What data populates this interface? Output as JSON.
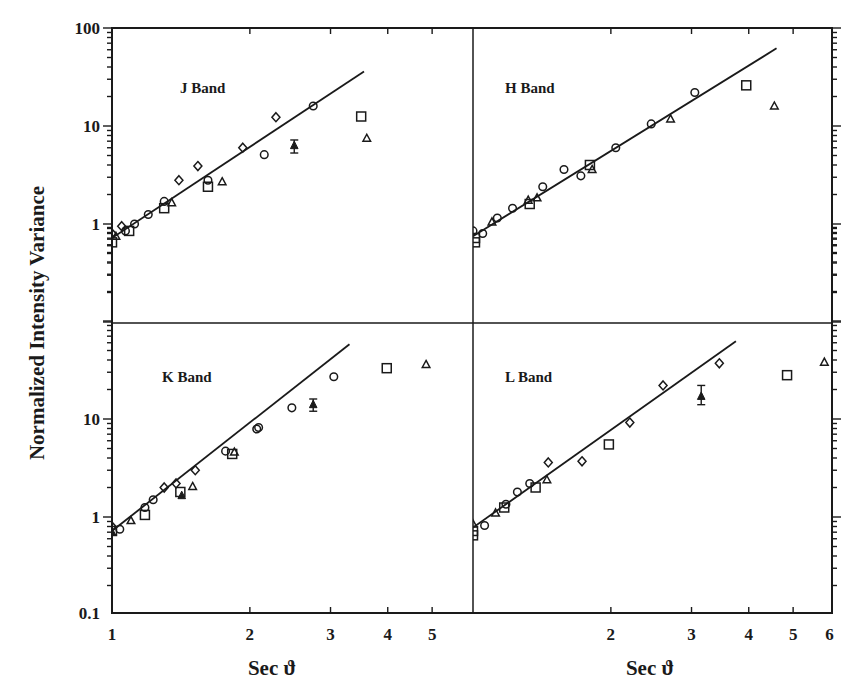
{
  "chart_data": {
    "type": "scatter",
    "title": "",
    "ylabel": "Normalized Intensity Variance",
    "xlabel": "Sec ϑ",
    "xscale": "log",
    "yscale": "log",
    "grid": false,
    "legend": "none",
    "layout": "2x2 panels sharing axes",
    "y_ticks_top": [
      "100",
      "10",
      "1"
    ],
    "y_ticks_bottom": [
      "10",
      "1",
      "0.1"
    ],
    "x_ticks_left": [
      "1",
      "2",
      "3",
      "4",
      "5"
    ],
    "x_ticks_right": [
      "2",
      "3",
      "4",
      "5",
      "6"
    ],
    "marker_types": [
      "diamond",
      "circle",
      "square",
      "triangle",
      "filled-triangle-with-errorbar"
    ],
    "panels": [
      {
        "id": "J",
        "label": "J Band",
        "xlim": [
          1,
          5.7
        ],
        "ylim": [
          0.1,
          100
        ],
        "fit_line": {
          "x": [
            1.0,
            3.55
          ],
          "y": [
            0.72,
            36
          ]
        },
        "points": [
          {
            "m": "diamond",
            "x": 1.0,
            "y": 0.8
          },
          {
            "m": "square",
            "x": 1.0,
            "y": 0.65
          },
          {
            "m": "triangle",
            "x": 1.02,
            "y": 0.75
          },
          {
            "m": "diamond",
            "x": 1.05,
            "y": 0.95
          },
          {
            "m": "circle",
            "x": 1.07,
            "y": 0.85
          },
          {
            "m": "square",
            "x": 1.09,
            "y": 0.85
          },
          {
            "m": "circle",
            "x": 1.12,
            "y": 1.0
          },
          {
            "m": "circle",
            "x": 1.2,
            "y": 1.25
          },
          {
            "m": "circle",
            "x": 1.3,
            "y": 1.7
          },
          {
            "m": "square",
            "x": 1.3,
            "y": 1.45
          },
          {
            "m": "triangle",
            "x": 1.35,
            "y": 1.65
          },
          {
            "m": "diamond",
            "x": 1.4,
            "y": 2.8
          },
          {
            "m": "diamond",
            "x": 1.54,
            "y": 3.9
          },
          {
            "m": "square",
            "x": 1.62,
            "y": 2.4
          },
          {
            "m": "circle",
            "x": 1.62,
            "y": 2.8
          },
          {
            "m": "triangle",
            "x": 1.74,
            "y": 2.7
          },
          {
            "m": "diamond",
            "x": 1.93,
            "y": 6.0
          },
          {
            "m": "circle",
            "x": 2.15,
            "y": 5.1
          },
          {
            "m": "diamond",
            "x": 2.28,
            "y": 12.3
          },
          {
            "m": "filled-triangle-with-errorbar",
            "x": 2.5,
            "y": 6.3,
            "err": [
              5.3,
              7.2
            ]
          },
          {
            "m": "circle",
            "x": 2.75,
            "y": 16.0
          },
          {
            "m": "square",
            "x": 3.5,
            "y": 12.5
          },
          {
            "m": "triangle",
            "x": 3.6,
            "y": 7.5
          }
        ]
      },
      {
        "id": "H",
        "label": "H Band",
        "xlim": [
          1,
          6
        ],
        "ylim": [
          0.1,
          100
        ],
        "fit_line": {
          "x": [
            1.0,
            4.6
          ],
          "y": [
            0.75,
            62
          ]
        },
        "points": [
          {
            "m": "circle",
            "x": 1.0,
            "y": 0.85
          },
          {
            "m": "square",
            "x": 1.01,
            "y": 0.65
          },
          {
            "m": "square",
            "x": 1.01,
            "y": 0.72
          },
          {
            "m": "circle",
            "x": 1.05,
            "y": 0.8
          },
          {
            "m": "triangle",
            "x": 1.1,
            "y": 1.05
          },
          {
            "m": "circle",
            "x": 1.13,
            "y": 1.15
          },
          {
            "m": "circle",
            "x": 1.22,
            "y": 1.45
          },
          {
            "m": "triangle",
            "x": 1.32,
            "y": 1.75
          },
          {
            "m": "square",
            "x": 1.33,
            "y": 1.6
          },
          {
            "m": "triangle",
            "x": 1.38,
            "y": 1.85
          },
          {
            "m": "circle",
            "x": 1.42,
            "y": 2.4
          },
          {
            "m": "circle",
            "x": 1.58,
            "y": 3.6
          },
          {
            "m": "circle",
            "x": 1.72,
            "y": 3.1
          },
          {
            "m": "square",
            "x": 1.8,
            "y": 4.0
          },
          {
            "m": "triangle",
            "x": 1.82,
            "y": 3.6
          },
          {
            "m": "circle",
            "x": 2.05,
            "y": 6.0
          },
          {
            "m": "circle",
            "x": 2.45,
            "y": 10.5
          },
          {
            "m": "triangle",
            "x": 2.7,
            "y": 11.8
          },
          {
            "m": "circle",
            "x": 3.05,
            "y": 22.0
          },
          {
            "m": "square",
            "x": 3.95,
            "y": 26.0
          },
          {
            "m": "triangle",
            "x": 4.55,
            "y": 16.0
          }
        ]
      },
      {
        "id": "K",
        "label": "K Band",
        "xlim": [
          1,
          5.7
        ],
        "ylim": [
          0.1,
          100
        ],
        "fit_line": {
          "x": [
            1.0,
            3.3
          ],
          "y": [
            0.72,
            58
          ]
        },
        "points": [
          {
            "m": "diamond",
            "x": 1.0,
            "y": 0.8
          },
          {
            "m": "square",
            "x": 1.0,
            "y": 0.72
          },
          {
            "m": "filled-triangle",
            "x": 1.0,
            "y": 0.7
          },
          {
            "m": "circle",
            "x": 1.04,
            "y": 0.75
          },
          {
            "m": "triangle",
            "x": 1.1,
            "y": 0.92
          },
          {
            "m": "circle",
            "x": 1.18,
            "y": 1.25
          },
          {
            "m": "square",
            "x": 1.18,
            "y": 1.05
          },
          {
            "m": "circle",
            "x": 1.23,
            "y": 1.5
          },
          {
            "m": "diamond",
            "x": 1.3,
            "y": 2.0
          },
          {
            "m": "diamond",
            "x": 1.38,
            "y": 2.2
          },
          {
            "m": "square",
            "x": 1.41,
            "y": 1.8
          },
          {
            "m": "filled-triangle",
            "x": 1.42,
            "y": 1.65
          },
          {
            "m": "triangle",
            "x": 1.5,
            "y": 2.05
          },
          {
            "m": "diamond",
            "x": 1.52,
            "y": 3.0
          },
          {
            "m": "circle",
            "x": 1.77,
            "y": 4.7
          },
          {
            "m": "square",
            "x": 1.83,
            "y": 4.4
          },
          {
            "m": "triangle",
            "x": 1.85,
            "y": 4.6
          },
          {
            "m": "circle",
            "x": 2.07,
            "y": 7.9
          },
          {
            "m": "circle",
            "x": 2.09,
            "y": 8.2
          },
          {
            "m": "circle",
            "x": 2.47,
            "y": 13.0
          },
          {
            "m": "filled-triangle-with-errorbar",
            "x": 2.75,
            "y": 14.0,
            "err": [
              12.0,
              16.0
            ]
          },
          {
            "m": "circle",
            "x": 3.05,
            "y": 27.0
          },
          {
            "m": "square",
            "x": 3.98,
            "y": 33.0
          },
          {
            "m": "triangle",
            "x": 4.85,
            "y": 36.0
          }
        ]
      },
      {
        "id": "L",
        "label": "L Band",
        "xlim": [
          1,
          6
        ],
        "ylim": [
          0.1,
          100
        ],
        "fit_line": {
          "x": [
            1.0,
            3.75
          ],
          "y": [
            0.78,
            62
          ]
        },
        "points": [
          {
            "m": "triangle",
            "x": 1.0,
            "y": 0.85
          },
          {
            "m": "square",
            "x": 1.0,
            "y": 0.65
          },
          {
            "m": "square",
            "x": 1.0,
            "y": 0.72
          },
          {
            "m": "circle",
            "x": 1.06,
            "y": 0.82
          },
          {
            "m": "triangle",
            "x": 1.12,
            "y": 1.1
          },
          {
            "m": "square",
            "x": 1.17,
            "y": 1.25
          },
          {
            "m": "circle",
            "x": 1.18,
            "y": 1.35
          },
          {
            "m": "circle",
            "x": 1.25,
            "y": 1.8
          },
          {
            "m": "circle",
            "x": 1.33,
            "y": 2.2
          },
          {
            "m": "square",
            "x": 1.37,
            "y": 2.0
          },
          {
            "m": "triangle",
            "x": 1.45,
            "y": 2.4
          },
          {
            "m": "diamond",
            "x": 1.46,
            "y": 3.6
          },
          {
            "m": "diamond",
            "x": 1.73,
            "y": 3.7
          },
          {
            "m": "square",
            "x": 1.98,
            "y": 5.5
          },
          {
            "m": "diamond",
            "x": 2.2,
            "y": 9.2
          },
          {
            "m": "diamond",
            "x": 2.6,
            "y": 22.0
          },
          {
            "m": "filled-triangle-with-errorbar",
            "x": 3.15,
            "y": 17.0,
            "err": [
              14.0,
              22.0
            ]
          },
          {
            "m": "diamond",
            "x": 3.45,
            "y": 37.0
          },
          {
            "m": "square",
            "x": 4.85,
            "y": 28.0
          },
          {
            "m": "triangle",
            "x": 5.85,
            "y": 38.0
          }
        ]
      }
    ]
  },
  "labels": {
    "y_axis": "Normalized Intensity Variance",
    "x_axis_left": "Sec ϑ",
    "x_axis_right": "Sec ϑ",
    "band_j": "J Band",
    "band_h": "H Band",
    "band_k": "K Band",
    "band_l": "L Band"
  }
}
